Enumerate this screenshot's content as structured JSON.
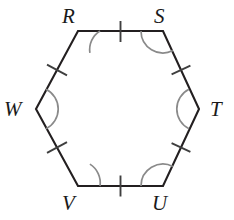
{
  "figure": {
    "shape": "hexagon",
    "sides": 6,
    "stroke_color": "#231f20",
    "arc_color": "#6f6f6f",
    "tick_color": "#4a4a4a",
    "background_color": "#ffffff",
    "vertices": [
      {
        "id": "R",
        "label": "R",
        "x": 78,
        "y": 31,
        "label_x": 62,
        "label_y": 6,
        "position": "top-left"
      },
      {
        "id": "S",
        "label": "S",
        "x": 163,
        "y": 31,
        "label_x": 154,
        "label_y": 6,
        "position": "top-right"
      },
      {
        "id": "T",
        "label": "T",
        "x": 199,
        "y": 109,
        "label_x": 210,
        "label_y": 99,
        "position": "right"
      },
      {
        "id": "U",
        "label": "U",
        "x": 163,
        "y": 186,
        "label_x": 152,
        "label_y": 193,
        "position": "bottom-right"
      },
      {
        "id": "V",
        "label": "V",
        "x": 78,
        "y": 186,
        "label_x": 62,
        "label_y": 193,
        "position": "bottom-left"
      },
      {
        "id": "W",
        "label": "W",
        "x": 36,
        "y": 109,
        "label_x": 4,
        "label_y": 99,
        "position": "left"
      }
    ],
    "sides_list": [
      {
        "id": "RS",
        "from": "R",
        "to": "S",
        "tick_marks": 1
      },
      {
        "id": "ST",
        "from": "S",
        "to": "T",
        "tick_marks": 1
      },
      {
        "id": "TU",
        "from": "T",
        "to": "U",
        "tick_marks": 1
      },
      {
        "id": "UV",
        "from": "U",
        "to": "V",
        "tick_marks": 1
      },
      {
        "id": "VW",
        "from": "V",
        "to": "W",
        "tick_marks": 1
      },
      {
        "id": "WR",
        "from": "W",
        "to": "R",
        "tick_marks": 1
      }
    ],
    "angle_marks": [
      {
        "at": "R",
        "arcs": 1
      },
      {
        "at": "S",
        "arcs": 1
      },
      {
        "at": "T",
        "arcs": 1
      },
      {
        "at": "U",
        "arcs": 1
      },
      {
        "at": "V",
        "arcs": 1
      },
      {
        "at": "W",
        "arcs": 1
      }
    ]
  }
}
